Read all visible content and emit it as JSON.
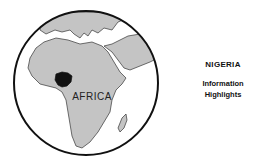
{
  "map": {
    "region_label": "AFRICA",
    "highlighted_country": "Nigeria",
    "colors": {
      "land": "#c4c4c4",
      "ocean": "#ffffff",
      "highlight": "#111111",
      "outline": "#111111"
    }
  },
  "caption": {
    "title": "NIGERIA",
    "subtitle_line1": "Information",
    "subtitle_line2": "Highlights"
  }
}
